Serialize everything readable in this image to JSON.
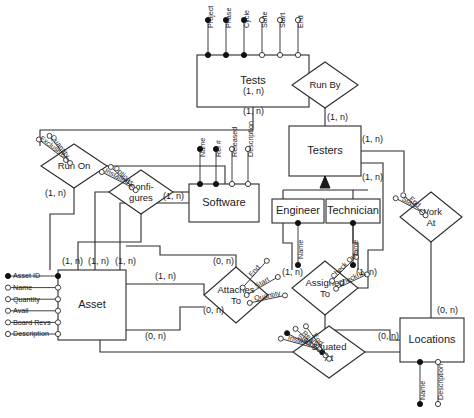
{
  "diagram": {
    "type": "entity-relationship-diagram",
    "width": 474,
    "height": 418,
    "colors": {
      "stroke": "#2b2b2b",
      "text": "#1a1a1a",
      "background": "#ffffff",
      "key_marker": "#111111"
    }
  },
  "entities": [
    {
      "id": "tests",
      "label": "Tests",
      "x": 197,
      "y": 55,
      "w": 112,
      "h": 52,
      "attributes": [
        {
          "label": "Project",
          "key": true
        },
        {
          "label": "Phase",
          "key": true
        },
        {
          "label": "Cycle",
          "key": true
        },
        {
          "label": "Suite",
          "key": false
        },
        {
          "label": "Start",
          "key": false
        },
        {
          "label": "End",
          "key": false
        }
      ]
    },
    {
      "id": "testers",
      "label": "Testers",
      "x": 289,
      "y": 126,
      "w": 72,
      "h": 50,
      "attributes": []
    },
    {
      "id": "engineer",
      "label": "Engineer",
      "x": 272,
      "y": 199,
      "w": 52,
      "h": 24,
      "attributes": [
        {
          "label": "Name",
          "key": true
        }
      ]
    },
    {
      "id": "technician",
      "label": "Technician",
      "x": 326,
      "y": 199,
      "w": 54,
      "h": 24,
      "attributes": [
        {
          "label": "Name",
          "key": true
        }
      ]
    },
    {
      "id": "software",
      "label": "Software",
      "x": 189,
      "y": 184,
      "w": 70,
      "h": 38,
      "attributes": [
        {
          "label": "Name",
          "key": true
        },
        {
          "label": "Rel #",
          "key": true
        },
        {
          "label": "Released",
          "key": false
        },
        {
          "label": "Description",
          "key": false
        }
      ]
    },
    {
      "id": "asset",
      "label": "Asset",
      "x": 58,
      "y": 270,
      "w": 68,
      "h": 70,
      "attributes": [
        {
          "label": "Asset ID",
          "key": true
        },
        {
          "label": "Name",
          "key": false
        },
        {
          "label": "Quantity",
          "key": false
        },
        {
          "label": "Avail",
          "key": false
        },
        {
          "label": "Board Revs",
          "key": false
        },
        {
          "label": "Description",
          "key": false
        }
      ]
    },
    {
      "id": "locations",
      "label": "Locations",
      "x": 400,
      "y": 318,
      "w": 64,
      "h": 44,
      "attributes": [
        {
          "label": "Name",
          "key": true
        },
        {
          "label": "Description",
          "key": false
        }
      ]
    }
  ],
  "relationships": [
    {
      "id": "run_by",
      "label": "Run By",
      "label_lines": [
        "Run By"
      ],
      "cx": 325,
      "cy": 85,
      "rx": 33,
      "ry": 23,
      "attributes": []
    },
    {
      "id": "run_on",
      "label": "Run On",
      "label_lines": [
        "Run On"
      ],
      "cx": 74,
      "cy": 166,
      "rx": 33,
      "ry": 22,
      "attributes": [
        {
          "label": "Exclusive",
          "key": false
        },
        {
          "label": "Quantity",
          "key": false
        }
      ]
    },
    {
      "id": "configures",
      "label": "Configures",
      "label_lines": [
        "Confi-",
        "gures"
      ],
      "cx": 141,
      "cy": 192,
      "rx": 32,
      "ry": 22,
      "attributes": [
        {
          "label": "Installed",
          "key": false
        },
        {
          "label": "Options",
          "key": false
        }
      ]
    },
    {
      "id": "work_at",
      "label": "Work At",
      "label_lines": [
        "Work",
        "At"
      ],
      "cx": 431,
      "cy": 217,
      "rx": 31,
      "ry": 25,
      "attributes": [
        {
          "label": "Start",
          "key": false
        },
        {
          "label": "End",
          "key": false
        }
      ]
    },
    {
      "id": "assigned_to",
      "label": "Assigned To",
      "label_lines": [
        "Assigned",
        "To"
      ],
      "cx": 325,
      "cy": 288,
      "rx": 33,
      "ry": 27,
      "attributes": [
        {
          "label": "Check Out",
          "key": false
        },
        {
          "label": "Check In",
          "key": false
        }
      ]
    },
    {
      "id": "attaches_to",
      "label": "Attaches To",
      "label_lines": [
        "Attaches",
        "To"
      ],
      "cx": 236,
      "cy": 295,
      "rx": 32,
      "ry": 28,
      "attributes": [
        {
          "label": "End",
          "key": false
        },
        {
          "label": "Start",
          "key": false
        },
        {
          "label": "Quantity",
          "key": false
        }
      ]
    },
    {
      "id": "situated_at",
      "label": "Situated At",
      "label_lines": [
        "Situated",
        "At"
      ],
      "cx": 329,
      "cy": 352,
      "rx": 36,
      "ry": 26,
      "attributes": [
        {
          "label": "Installer",
          "key": false
        },
        {
          "label": "Start",
          "key": true
        },
        {
          "label": "Ready",
          "key": false
        },
        {
          "label": "End",
          "key": false
        }
      ]
    }
  ],
  "cardinalities": [
    {
      "id": "c1",
      "text": "(1, n)",
      "x": 243,
      "y": 92,
      "note": "Tests to Run By"
    },
    {
      "id": "c2",
      "text": "(1, n)",
      "x": 243,
      "y": 112,
      "note": "Tests bottom"
    },
    {
      "id": "c3",
      "text": "(1, n)",
      "x": 327,
      "y": 118,
      "note": "Run By to Testers"
    },
    {
      "id": "c4",
      "text": "(1, n)",
      "x": 362,
      "y": 140,
      "note": "Testers right upper"
    },
    {
      "id": "c5",
      "text": "(1, n)",
      "x": 362,
      "y": 178,
      "note": "Testers right lower"
    },
    {
      "id": "c6",
      "text": "(1, n)",
      "x": 45,
      "y": 194,
      "note": "Run On to Asset"
    },
    {
      "id": "c7",
      "text": "(1, n)",
      "x": 163,
      "y": 197,
      "note": "Configures to Software"
    },
    {
      "id": "c8",
      "text": "(1, n)",
      "x": 62,
      "y": 262,
      "note": "Asset top 1"
    },
    {
      "id": "c9",
      "text": "(1, n)",
      "x": 88,
      "y": 262,
      "note": "Asset top 2"
    },
    {
      "id": "c10",
      "text": "(1, n)",
      "x": 115,
      "y": 262,
      "note": "Asset top 3"
    },
    {
      "id": "c11",
      "text": "(1, n)",
      "x": 155,
      "y": 277,
      "note": "Asset right to Attaches"
    },
    {
      "id": "c12",
      "text": "(0, n)",
      "x": 213,
      "y": 262,
      "note": "Attaches To top"
    },
    {
      "id": "c13",
      "text": "(0, n)",
      "x": 203,
      "y": 311,
      "note": "Attaches To left"
    },
    {
      "id": "c14",
      "text": "(0, n)",
      "x": 145,
      "y": 337,
      "note": "Asset bottom to Situated"
    },
    {
      "id": "c15",
      "text": "(1, n)",
      "x": 282,
      "y": 273,
      "note": "Engineer to Assigned To"
    },
    {
      "id": "c16",
      "text": "(1, n)",
      "x": 356,
      "y": 273,
      "note": "Technician to Assigned To"
    },
    {
      "id": "c17",
      "text": "(0, n)",
      "x": 437,
      "y": 311,
      "note": "Work At to Locations"
    },
    {
      "id": "c18",
      "text": "(0, n)",
      "x": 378,
      "y": 337,
      "note": "Situated At to Locations"
    }
  ],
  "notation": {
    "key_attribute": "filled-circle",
    "optional_attribute": "open-circle",
    "subtype_symbol": "isa-triangle",
    "subtype_parent": "Testers",
    "subtype_children": [
      "Engineer",
      "Technician"
    ]
  }
}
